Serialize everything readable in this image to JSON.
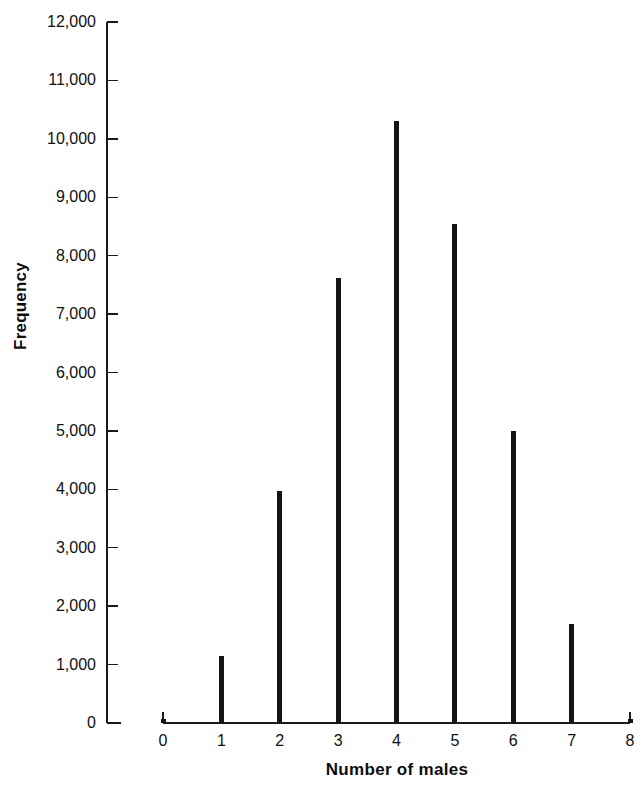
{
  "chart_data": {
    "type": "bar",
    "title": "",
    "subtitle": "",
    "xlabel": "Number of males",
    "ylabel": "Frequency",
    "categories": [
      0,
      1,
      2,
      3,
      4,
      5,
      6,
      7,
      8
    ],
    "values": [
      60,
      1150,
      3970,
      7620,
      10300,
      8550,
      5000,
      1700,
      70
    ],
    "xlim": [
      0,
      8
    ],
    "ylim": [
      0,
      12000
    ],
    "x_tick_labels": [
      "0",
      "1",
      "2",
      "3",
      "4",
      "5",
      "6",
      "7",
      "8"
    ],
    "y_tick_values": [
      0,
      1000,
      2000,
      3000,
      4000,
      5000,
      6000,
      7000,
      8000,
      9000,
      10000,
      11000,
      12000
    ],
    "y_tick_labels": [
      "0",
      "1,000",
      "2,000",
      "3,000",
      "4,000",
      "5,000",
      "6,000",
      "7,000",
      "8,000",
      "9,000",
      "10,000",
      "11,000",
      "12,000"
    ],
    "grid": false,
    "legend": null,
    "bar_color": "#141414",
    "axis_color": "#1a1a1a",
    "bar_width_px": 5
  }
}
